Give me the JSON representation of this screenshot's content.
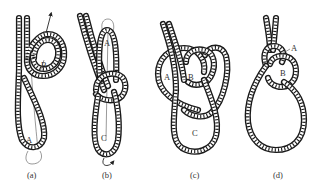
{
  "figure": {
    "panels": [
      {
        "id": "a",
        "caption": "(a)",
        "labels": {
          "A": "A",
          "B": "B"
        }
      },
      {
        "id": "b",
        "caption": "(b)",
        "labels": {
          "A": "A",
          "C": "C"
        }
      },
      {
        "id": "c",
        "caption": "(c)",
        "labels": {
          "A": "A",
          "B": "B",
          "C": "C"
        }
      },
      {
        "id": "d",
        "caption": "(d)",
        "labels": {
          "A": "A",
          "B": "B"
        }
      }
    ]
  },
  "colors": {
    "rope": "#1a1a1a",
    "background": "#ffffff",
    "text": "#333333"
  }
}
